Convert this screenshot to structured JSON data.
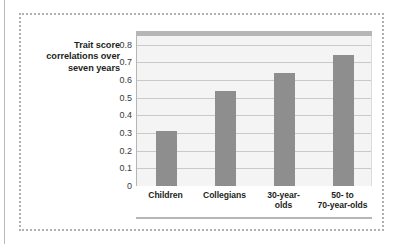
{
  "figure": {
    "axis_title_lines": [
      "Trait score",
      "correlations over",
      "seven years"
    ],
    "axis_title_text": "Trait score correlations over seven years"
  },
  "colors": {
    "bar": "#8e8e8e",
    "plot_background": "#f4f4f4",
    "gridline": "#c9c9c9",
    "frame_dotted": "#b0b0b0",
    "axis": "#b6b6b6",
    "text": "#231f20"
  },
  "chart_data": {
    "type": "bar",
    "title": "",
    "xlabel": "",
    "ylabel": "Trait score correlations over seven years",
    "categories": [
      "Children",
      "Collegians",
      "30-year-olds",
      "50- to 70-year-olds"
    ],
    "category_lines": [
      [
        "Children"
      ],
      [
        "Collegians"
      ],
      [
        "30-year-",
        "olds"
      ],
      [
        "50-  to",
        "70-year-olds"
      ]
    ],
    "values": [
      0.31,
      0.54,
      0.64,
      0.74
    ],
    "ylim": [
      0,
      0.85
    ],
    "yticks": [
      0,
      0.1,
      0.2,
      0.3,
      0.4,
      0.5,
      0.6,
      0.7,
      0.8
    ],
    "ytick_labels": [
      "0",
      "0.1",
      "0.2",
      "0.3",
      "0.4",
      "0.5",
      "0.6",
      "0.7",
      "0.8"
    ],
    "grid": true,
    "legend": "none"
  }
}
